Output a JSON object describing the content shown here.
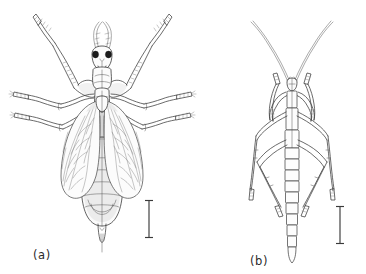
{
  "figure": {
    "type": "scientific-line-drawing-plate",
    "background_color": "#ffffff",
    "ink_color": "#3a3a3a",
    "panel_count": 2
  },
  "panels": [
    {
      "id": "a",
      "label": "(a)",
      "subject": "adult winged insect, dorsal view",
      "features": [
        "raptorial forelegs raised",
        "two large dark compound eyes",
        "short segmented antennae",
        "two pairs of veined wings folded over abdomen",
        "broad segmented abdomen with terminal appendage",
        "two pairs of slender walking legs"
      ],
      "scale_bar": {
        "orientation": "vertical",
        "style": "I-beam with serifs"
      }
    },
    {
      "id": "b",
      "label": "(b)",
      "subject": "nymph / larval instar, dorsal view",
      "features": [
        "very long curved filamentous antennae",
        "raptorial forelegs folded",
        "narrow elongate ladder-segmented abdomen",
        "two pairs of long slender legs"
      ],
      "scale_bar": {
        "orientation": "vertical",
        "style": "I-beam with serifs"
      }
    }
  ],
  "labels": {
    "panel_a": "(a)",
    "panel_b": "(b)"
  }
}
